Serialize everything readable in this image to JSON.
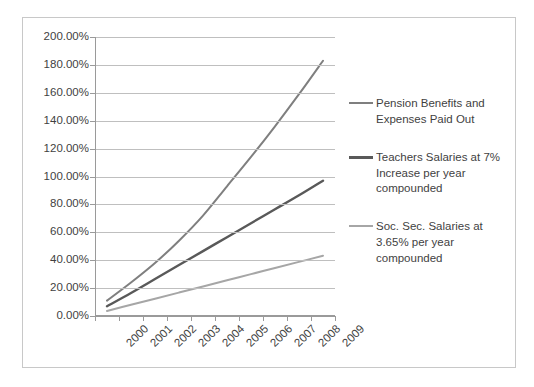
{
  "chart_data": {
    "type": "line",
    "title": "",
    "xlabel": "",
    "ylabel": "",
    "categories": [
      "2000",
      "2001",
      "2002",
      "2003",
      "2004",
      "2005",
      "2006",
      "2007",
      "2008",
      "2009"
    ],
    "ylim": [
      0,
      200
    ],
    "y_tick_values": [
      0,
      20,
      40,
      60,
      80,
      100,
      120,
      140,
      160,
      180,
      200
    ],
    "y_tick_labels": [
      "0.00%",
      "20.00%",
      "40.00%",
      "60.00%",
      "80.00%",
      "100.00%",
      "120.00%",
      "140.00%",
      "160.00%",
      "180.00%",
      "200.00%"
    ],
    "grid": true,
    "legend_position": "right",
    "series": [
      {
        "name": "Pension Benefits and Expenses Paid Out",
        "color": "#7f7f7f",
        "width": 2,
        "values": [
          11.0,
          24.0,
          38.0,
          54.0,
          72.0,
          93.0,
          114.0,
          136.0,
          159.0,
          183.0
        ]
      },
      {
        "name": "Teachers Salaries at 7% Increase per year compounded",
        "color": "#595959",
        "width": 2.4,
        "values": [
          7.0,
          16.5,
          26.5,
          36.5,
          46.5,
          56.5,
          66.5,
          76.5,
          86.5,
          97.0
        ]
      },
      {
        "name": "Soc. Sec. Salaries at 3.65% per year compounded",
        "color": "#a6a6a6",
        "width": 2,
        "values": [
          3.65,
          8.0,
          12.4,
          16.8,
          21.2,
          25.6,
          30.0,
          34.4,
          38.8,
          43.2
        ]
      }
    ]
  },
  "legend": {
    "entries": [
      {
        "label": "Pension Benefits and Expenses Paid Out"
      },
      {
        "label": "Teachers Salaries at 7% Increase per year compounded"
      },
      {
        "label": "Soc. Sec. Salaries at 3.65% per year compounded"
      }
    ]
  },
  "colors": {
    "border": "#c8c8c8",
    "gridline": "#bfbfbf",
    "axis": "#9a9a9a",
    "text": "#3f3f3f",
    "background": "#ffffff"
  }
}
